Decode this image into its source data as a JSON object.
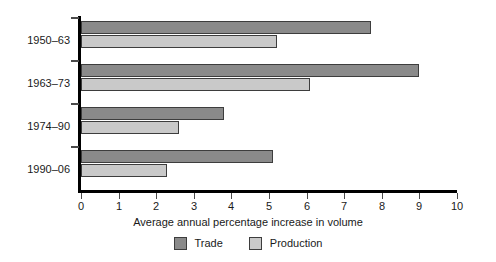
{
  "chart_data": {
    "type": "bar",
    "orientation": "horizontal",
    "title": "",
    "xlabel": "Average annual percentage increase in volume",
    "ylabel": "",
    "xlim": [
      0,
      10
    ],
    "xticks": [
      "0",
      "1",
      "2",
      "3",
      "4",
      "5",
      "6",
      "7",
      "8",
      "9",
      "10"
    ],
    "grid": false,
    "legend_position": "bottom-center",
    "categories": [
      "1950–63",
      "1963–73",
      "1974–90",
      "1990–06"
    ],
    "series": [
      {
        "name": "Trade",
        "color": "#8a8a8a",
        "values": [
          7.7,
          9.0,
          3.8,
          5.1
        ]
      },
      {
        "name": "Production",
        "color": "#c9c9c9",
        "values": [
          5.2,
          6.1,
          2.6,
          2.3
        ]
      }
    ]
  },
  "legend": {
    "entries": [
      {
        "label": "Trade",
        "swatch": "trade-swatch"
      },
      {
        "label": "Production",
        "swatch": "production-swatch"
      }
    ]
  },
  "axis": {
    "x_title": "Average annual percentage increase in volume"
  }
}
